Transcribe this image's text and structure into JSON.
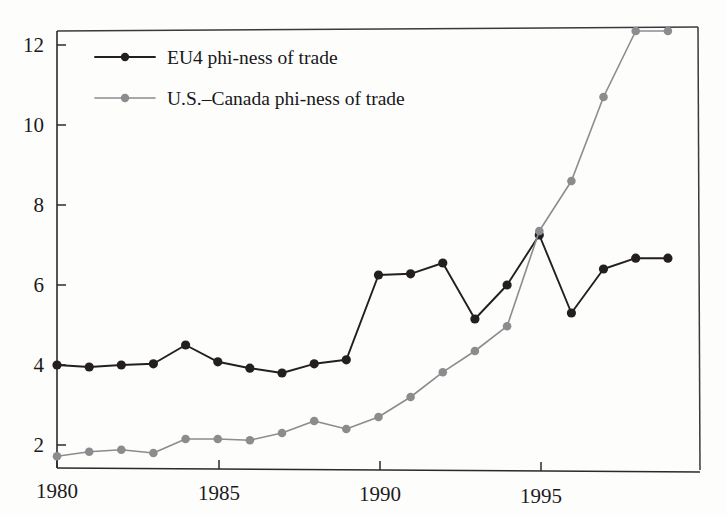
{
  "chart_data": {
    "type": "line",
    "title": "",
    "subtitle": "",
    "xlabel": "",
    "ylabel": "",
    "xlim": [
      1979.4,
      1999.6
    ],
    "ylim": [
      1.35,
      12.75
    ],
    "grid": false,
    "legend_position": "inside top-left",
    "x": [
      1980,
      1981,
      1982,
      1983,
      1984,
      1985,
      1986,
      1987,
      1988,
      1989,
      1990,
      1991,
      1992,
      1993,
      1994,
      1995,
      1996,
      1997,
      1998,
      1999
    ],
    "xticks": [
      1980,
      1985,
      1990,
      1995
    ],
    "xtick_labels": [
      "1980",
      "1985",
      "1990",
      "1995"
    ],
    "yticks": [
      2,
      4,
      6,
      8,
      10,
      12
    ],
    "ytick_labels": [
      "2",
      "4",
      "6",
      "8",
      "10",
      "12"
    ],
    "series": [
      {
        "name": "EU4 phi-ness of trade",
        "color": "#231f20",
        "marker": "circle",
        "values": [
          4.0,
          3.95,
          4.0,
          4.03,
          4.5,
          4.08,
          3.92,
          3.8,
          4.03,
          4.13,
          6.25,
          6.28,
          6.55,
          5.15,
          6.0,
          7.25,
          5.3,
          6.4,
          6.67,
          6.67
        ]
      },
      {
        "name": "U.S.–Canada phi-ness of trade",
        "color": "#8c8c8e",
        "marker": "circle",
        "values": [
          1.72,
          1.83,
          1.88,
          1.8,
          2.15,
          2.15,
          2.12,
          2.3,
          2.6,
          2.4,
          2.7,
          3.2,
          3.82,
          4.35,
          4.97,
          7.35,
          8.6,
          10.7,
          12.35,
          12.35
        ]
      }
    ]
  },
  "legend": {
    "entries": [
      {
        "label": "EU4 phi-ness of trade",
        "color": "#231f20"
      },
      {
        "label": "U.S.–Canada phi-ness of trade",
        "color": "#8c8c8e"
      }
    ]
  },
  "axes": {
    "y_labels": [
      "12",
      "10",
      "8",
      "6",
      "4",
      "2"
    ],
    "x_labels": [
      "1980",
      "1985",
      "1990",
      "1995"
    ]
  }
}
